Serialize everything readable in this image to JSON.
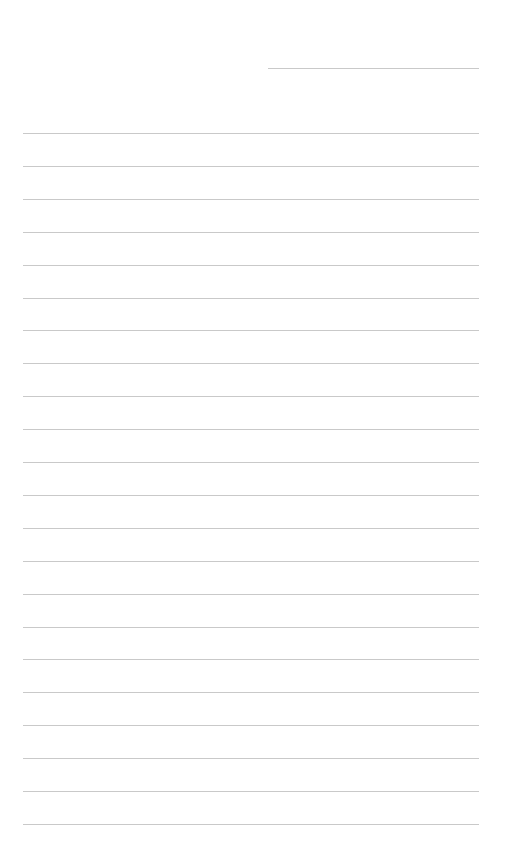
{
  "document": {
    "type": "lined-paper",
    "header_line": {
      "label": ""
    },
    "line_count": 22,
    "line_spacing_px": 32.9,
    "colors": {
      "background": "#ffffff",
      "rule": "#c9c9c9"
    },
    "lines": [
      "",
      "",
      "",
      "",
      "",
      "",
      "",
      "",
      "",
      "",
      "",
      "",
      "",
      "",
      "",
      "",
      "",
      "",
      "",
      "",
      "",
      ""
    ]
  }
}
